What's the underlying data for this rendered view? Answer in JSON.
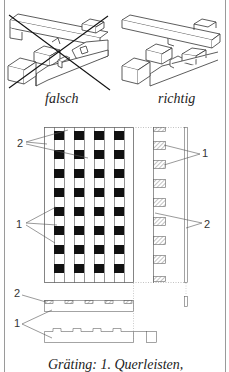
{
  "figure": {
    "top_panel": {
      "left_caption": "falsch",
      "right_caption": "richtig"
    },
    "plan_view": {
      "columns_of_blocks": 4,
      "rows_of_blocks": 8,
      "labels": {
        "left_upper": "2",
        "left_lower": "1",
        "right_upper": "1",
        "right_lower": "2"
      }
    },
    "section_view": {
      "labels": {
        "upper": "2",
        "lower": "1"
      }
    },
    "caption": "Gräting: 1. Querleisten,"
  },
  "colors": {
    "line": "#555555",
    "block_fill": "#111111",
    "hatch": "#777777",
    "frame": "#9a9a9a",
    "background": "#ffffff"
  }
}
